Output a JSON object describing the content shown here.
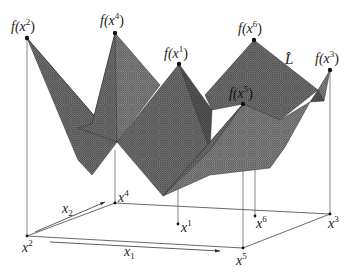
{
  "figure": {
    "type": "piecewise-linear surface over 2D domain",
    "surface_label": "L̂",
    "surface_color": "#6e6e6e",
    "mesh_color": "#4a4a4a",
    "line_color": "#333333",
    "axes": {
      "x1_label": "x",
      "x1_sub": "1",
      "x2_label": "x",
      "x2_sub": "2"
    },
    "points": [
      {
        "id": "x2",
        "base_label": "x",
        "sup": "2",
        "value_label": "f(x",
        "value_sup": "2",
        "value_close": ")"
      },
      {
        "id": "x4",
        "base_label": "x",
        "sup": "4",
        "value_label": "f(x",
        "value_sup": "4",
        "value_close": ")"
      },
      {
        "id": "x1",
        "base_label": "x",
        "sup": "1",
        "value_label": "f(x",
        "value_sup": "1",
        "value_close": ")"
      },
      {
        "id": "x6",
        "base_label": "x",
        "sup": "6",
        "value_label": "f(x",
        "value_sup": "6",
        "value_close": ")"
      },
      {
        "id": "x3",
        "base_label": "x",
        "sup": "3",
        "value_label": "f(x",
        "value_sup": "3",
        "value_close": ")"
      },
      {
        "id": "x5",
        "base_label": "x",
        "sup": "5",
        "value_label": "f(x",
        "value_sup": "5",
        "value_close": ")"
      }
    ]
  }
}
